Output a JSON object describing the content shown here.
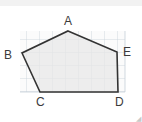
{
  "figure": {
    "type": "geometry-diagram",
    "shape": "pentagon",
    "canvas": {
      "width": 142,
      "height": 122,
      "background": "#ffffff"
    },
    "top_strip_color": "#f2f2f2",
    "grid": {
      "visible": true,
      "line_color": "#c5cfd8",
      "cell_size": 13,
      "left": 20,
      "top": 31,
      "right": 125,
      "bottom": 92,
      "columns": 8,
      "rows": 5
    },
    "polygon": {
      "fill": "#e8e8e8",
      "stroke": "#333333",
      "stroke_width": 1.6,
      "points": "68,31 117,52 118,92 40,92 22,53"
    },
    "vertices": [
      {
        "id": "A",
        "label": "A",
        "x": 68,
        "y": 31
      },
      {
        "id": "B",
        "label": "B",
        "x": 22,
        "y": 53
      },
      {
        "id": "C",
        "label": "C",
        "x": 40,
        "y": 92
      },
      {
        "id": "D",
        "label": "D",
        "x": 118,
        "y": 92
      },
      {
        "id": "E",
        "label": "E",
        "x": 117,
        "y": 52
      }
    ],
    "label_color": "#3b3b3b",
    "corner_mark": "◢"
  }
}
